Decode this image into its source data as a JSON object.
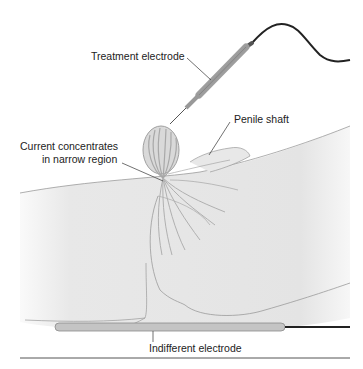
{
  "labels": {
    "treatment_electrode": "Treatment electrode",
    "penile_shaft": "Penile shaft",
    "current_line1": "Current concentrates",
    "current_line2": "in narrow region",
    "indifferent_electrode": "Indifferent electrode"
  },
  "colors": {
    "body_fill": "#e6e6e6",
    "outline": "#9a9a9a",
    "current_lines": "#a8a8a8",
    "cable": "#222222",
    "electrode": "#c4c4c4"
  }
}
